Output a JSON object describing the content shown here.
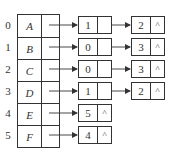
{
  "diagram": {
    "type": "adjacency-list",
    "null_symbol": "^",
    "vertices": [
      {
        "index": "0",
        "name": "A",
        "edges": [
          {
            "adj": "1",
            "next": "→"
          },
          {
            "adj": "2",
            "next": "^"
          }
        ]
      },
      {
        "index": "1",
        "name": "B",
        "edges": [
          {
            "adj": "0",
            "next": "→"
          },
          {
            "adj": "3",
            "next": "^"
          }
        ]
      },
      {
        "index": "2",
        "name": "C",
        "edges": [
          {
            "adj": "0",
            "next": "→"
          },
          {
            "adj": "3",
            "next": "^"
          }
        ]
      },
      {
        "index": "3",
        "name": "D",
        "edges": [
          {
            "adj": "1",
            "next": "→"
          },
          {
            "adj": "2",
            "next": "^"
          }
        ]
      },
      {
        "index": "4",
        "name": "E",
        "edges": [
          {
            "adj": "5",
            "next": "^"
          }
        ]
      },
      {
        "index": "5",
        "name": "F",
        "edges": [
          {
            "adj": "4",
            "next": "^"
          }
        ]
      }
    ]
  },
  "labels": {
    "idx0": "0",
    "idx1": "1",
    "idx2": "2",
    "idx3": "3",
    "idx4": "4",
    "idx5": "5",
    "v0": "A",
    "v1": "B",
    "v2": "C",
    "v3": "D",
    "v4": "E",
    "v5": "F",
    "n0a": "1",
    "n0b": "2",
    "n1a": "0",
    "n1b": "3",
    "n2a": "0",
    "n2b": "3",
    "n3a": "1",
    "n3b": "2",
    "n4a": "5",
    "n5a": "4",
    "null": "^"
  }
}
